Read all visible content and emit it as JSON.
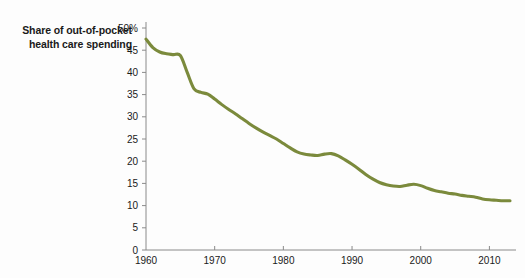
{
  "chart_title": "Share of out-of-pocket health care spending",
  "chart_data": {
    "type": "line",
    "title": "Share of out-of-pocket health care spending",
    "xlabel": "",
    "ylabel": "",
    "xlim": [
      1960,
      2013
    ],
    "ylim": [
      0,
      50
    ],
    "grid": false,
    "legend": null,
    "line_color": "#7b8a3c",
    "y_ticks": [
      0,
      5,
      10,
      15,
      20,
      25,
      30,
      35,
      40,
      45,
      50
    ],
    "y_tick_labels": [
      "0",
      "5",
      "10",
      "15",
      "20",
      "25",
      "30",
      "35",
      "40",
      "45",
      "50%"
    ],
    "x_ticks": [
      1960,
      1970,
      1980,
      1990,
      2000,
      2010
    ],
    "x_tick_labels": [
      "1960",
      "1970",
      "1980",
      "1990",
      "2000",
      "2010"
    ],
    "series": [
      {
        "name": "Share of out-of-pocket health care spending",
        "x": [
          1960,
          1961,
          1962,
          1963,
          1964,
          1965,
          1966,
          1967,
          1968,
          1969,
          1970,
          1971,
          1972,
          1973,
          1974,
          1975,
          1976,
          1977,
          1978,
          1979,
          1980,
          1981,
          1982,
          1983,
          1984,
          1985,
          1986,
          1987,
          1988,
          1989,
          1990,
          1991,
          1992,
          1993,
          1994,
          1995,
          1996,
          1997,
          1998,
          1999,
          2000,
          2001,
          2002,
          2003,
          2004,
          2005,
          2006,
          2007,
          2008,
          2009,
          2010,
          2011,
          2012,
          2013
        ],
        "values": [
          47.5,
          45.6,
          44.6,
          44.2,
          44.0,
          43.8,
          40.0,
          36.3,
          35.5,
          35.1,
          34.0,
          32.8,
          31.7,
          30.7,
          29.6,
          28.5,
          27.5,
          26.6,
          25.8,
          25.0,
          24.0,
          23.0,
          22.1,
          21.6,
          21.4,
          21.3,
          21.6,
          21.7,
          21.2,
          20.3,
          19.3,
          18.2,
          17.0,
          16.0,
          15.2,
          14.7,
          14.4,
          14.3,
          14.6,
          14.8,
          14.5,
          13.9,
          13.4,
          13.1,
          12.8,
          12.6,
          12.3,
          12.1,
          11.9,
          11.5,
          11.3,
          11.2,
          11.1,
          11.1
        ]
      }
    ]
  }
}
